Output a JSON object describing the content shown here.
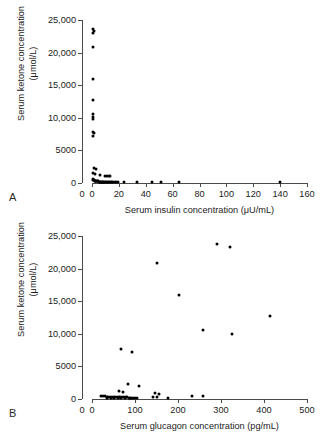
{
  "figure": {
    "shared_ylabel_line1": "Serum ketone concentration",
    "shared_ylabel_line2": "(μmol/L)"
  },
  "panel_a": {
    "letter": "A",
    "ylabel_line1": "Serum ketone concentration",
    "ylabel_line2": "(μmol/L)",
    "xlabel": "Serum insulin concentration (μU/mL)",
    "origin_label": "0",
    "yticks": [
      "25,000",
      "20,000",
      "15,000",
      "10,000",
      "5000",
      "0"
    ],
    "xticks": [
      "0",
      "20",
      "40",
      "60",
      "80",
      "100",
      "120",
      "140",
      "160"
    ]
  },
  "panel_b": {
    "letter": "B",
    "ylabel_line1": "Serum ketone concentration",
    "ylabel_line2": "(μmol/L)",
    "xlabel": "Serum glucagon concentration (pg/mL)",
    "origin_label": "0",
    "yticks": [
      "25,000",
      "20,000",
      "15,000",
      "10,000",
      "5000",
      "0"
    ],
    "xticks": [
      "0",
      "100",
      "200",
      "300",
      "400",
      "500"
    ]
  },
  "chart_data": [
    {
      "type": "scatter",
      "panel": "A",
      "title": "",
      "xlabel": "Serum insulin concentration (μU/mL)",
      "ylabel": "Serum ketone concentration (μmol/L)",
      "xlim": [
        0,
        160
      ],
      "ylim": [
        0,
        25000
      ],
      "xticks": [
        0,
        20,
        40,
        60,
        80,
        100,
        120,
        140,
        160
      ],
      "yticks": [
        0,
        5000,
        10000,
        15000,
        20000,
        25000
      ],
      "grid": false,
      "legend": null,
      "marker": "filled-circle",
      "marker_color": "#000000",
      "points": [
        [
          0.8,
          23600
        ],
        [
          1.2,
          23300
        ],
        [
          1.0,
          23000
        ],
        [
          1.1,
          20900
        ],
        [
          0.9,
          16000
        ],
        [
          1.0,
          12700
        ],
        [
          0.9,
          10600
        ],
        [
          1.1,
          10100
        ],
        [
          1.0,
          9800
        ],
        [
          0.9,
          7800
        ],
        [
          1.2,
          7600
        ],
        [
          1.0,
          7200
        ],
        [
          1.4,
          2300
        ],
        [
          3.0,
          2200
        ],
        [
          1.0,
          1500
        ],
        [
          2.2,
          1400
        ],
        [
          6.0,
          1250
        ],
        [
          9.5,
          1150
        ],
        [
          11.0,
          1100
        ],
        [
          12.5,
          1050
        ],
        [
          13.5,
          1000
        ],
        [
          0.5,
          600
        ],
        [
          0.8,
          500
        ],
        [
          1.2,
          450
        ],
        [
          1.6,
          400
        ],
        [
          2.0,
          350
        ],
        [
          2.4,
          330
        ],
        [
          2.9,
          300
        ],
        [
          3.3,
          280
        ],
        [
          3.8,
          260
        ],
        [
          4.3,
          250
        ],
        [
          4.8,
          240
        ],
        [
          5.4,
          230
        ],
        [
          5.9,
          220
        ],
        [
          6.4,
          210
        ],
        [
          6.9,
          200
        ],
        [
          7.4,
          190
        ],
        [
          7.9,
          185
        ],
        [
          8.5,
          180
        ],
        [
          9.1,
          175
        ],
        [
          9.7,
          170
        ],
        [
          10.3,
          165
        ],
        [
          11.0,
          160
        ],
        [
          11.8,
          155
        ],
        [
          12.6,
          150
        ],
        [
          13.4,
          150
        ],
        [
          14.2,
          145
        ],
        [
          15.0,
          145
        ],
        [
          15.9,
          140
        ],
        [
          16.8,
          140
        ],
        [
          18.2,
          135
        ],
        [
          19.6,
          130
        ],
        [
          23.5,
          130
        ],
        [
          33.5,
          130
        ],
        [
          44.5,
          130
        ],
        [
          51.5,
          130
        ],
        [
          64.5,
          130
        ],
        [
          140.0,
          150
        ]
      ]
    },
    {
      "type": "scatter",
      "panel": "B",
      "title": "",
      "xlabel": "Serum glucagon concentration (pg/mL)",
      "ylabel": "Serum ketone concentration (μmol/L)",
      "xlim": [
        0,
        500
      ],
      "ylim": [
        0,
        25000
      ],
      "xticks": [
        0,
        100,
        200,
        300,
        400,
        500
      ],
      "yticks": [
        0,
        5000,
        10000,
        15000,
        20000,
        25000
      ],
      "grid": false,
      "legend": null,
      "marker": "filled-circle",
      "marker_color": "#000000",
      "points": [
        [
          290,
          23700
        ],
        [
          322,
          23300
        ],
        [
          152,
          20900
        ],
        [
          202,
          16000
        ],
        [
          415,
          12700
        ],
        [
          258,
          10600
        ],
        [
          325,
          9900
        ],
        [
          68,
          7700
        ],
        [
          94,
          7200
        ],
        [
          84,
          2250
        ],
        [
          110,
          2050
        ],
        [
          63,
          1200
        ],
        [
          72,
          1100
        ],
        [
          146,
          900
        ],
        [
          156,
          800
        ],
        [
          22,
          500
        ],
        [
          26,
          430
        ],
        [
          30,
          400
        ],
        [
          34,
          380
        ],
        [
          38,
          360
        ],
        [
          42,
          340
        ],
        [
          46,
          320
        ],
        [
          50,
          300
        ],
        [
          54,
          290
        ],
        [
          58,
          280
        ],
        [
          62,
          270
        ],
        [
          66,
          260
        ],
        [
          70,
          250
        ],
        [
          74,
          245
        ],
        [
          78,
          240
        ],
        [
          82,
          235
        ],
        [
          86,
          230
        ],
        [
          90,
          225
        ],
        [
          95,
          220
        ],
        [
          100,
          215
        ],
        [
          36,
          180
        ],
        [
          44,
          170
        ],
        [
          52,
          165
        ],
        [
          60,
          160
        ],
        [
          68,
          155
        ],
        [
          76,
          150
        ],
        [
          88,
          150
        ],
        [
          104,
          150
        ],
        [
          142,
          260
        ],
        [
          152,
          250
        ],
        [
          176,
          180
        ],
        [
          232,
          520
        ],
        [
          258,
          420
        ]
      ]
    }
  ]
}
